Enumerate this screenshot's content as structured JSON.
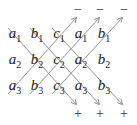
{
  "diagram": {
    "grid": [
      [
        {
          "letter": "a",
          "sub": "1"
        },
        {
          "letter": "b",
          "sub": "1"
        },
        {
          "letter": "c",
          "sub": "1"
        },
        {
          "letter": "a",
          "sub": "1"
        },
        {
          "letter": "b",
          "sub": "1"
        }
      ],
      [
        {
          "letter": "a",
          "sub": "2"
        },
        {
          "letter": "b",
          "sub": "2"
        },
        {
          "letter": "c",
          "sub": "2"
        },
        {
          "letter": "a",
          "sub": "2"
        },
        {
          "letter": "b",
          "sub": "2"
        }
      ],
      [
        {
          "letter": "a",
          "sub": "3"
        },
        {
          "letter": "b",
          "sub": "3"
        },
        {
          "letter": "c",
          "sub": "3"
        },
        {
          "letter": "a",
          "sub": "3"
        },
        {
          "letter": "b",
          "sub": "3"
        }
      ]
    ],
    "top_signs": [
      "−",
      "−",
      "−"
    ],
    "bottom_signs": [
      "+",
      "+",
      "+"
    ],
    "line_color": "#8a8a8a",
    "text_color": "#222222"
  }
}
